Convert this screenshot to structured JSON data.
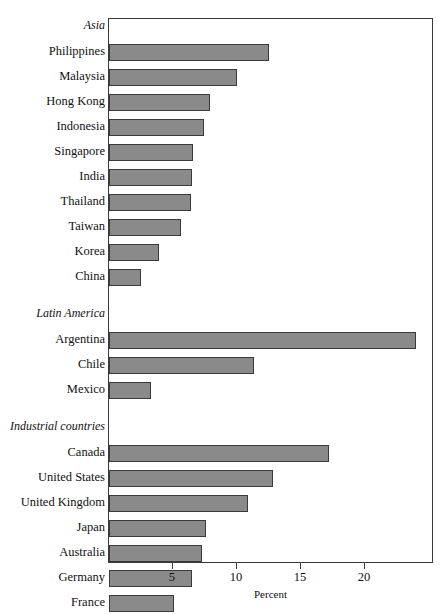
{
  "chart_data": {
    "type": "bar",
    "orientation": "horizontal",
    "title": "",
    "xlabel": "Percent",
    "ylabel": "",
    "xlim": [
      0,
      25.4
    ],
    "grid": false,
    "legend": null,
    "xticks": [
      5,
      10,
      15,
      20
    ],
    "xtick_labels": [
      "5",
      "10",
      "15",
      "20"
    ],
    "groups": [
      {
        "name": "Asia",
        "categories": [
          "Philippines",
          "Malaysia",
          "Hong Kong",
          "Indonesia",
          "Singapore",
          "India",
          "Thailand",
          "Taiwan",
          "Korea",
          "China"
        ],
        "values": [
          12.5,
          10.0,
          7.9,
          7.4,
          6.6,
          6.5,
          6.4,
          5.6,
          3.9,
          2.5
        ]
      },
      {
        "name": "Latin America",
        "categories": [
          "Argentina",
          "Chile",
          "Mexico"
        ],
        "values": [
          24.0,
          11.3,
          3.3
        ]
      },
      {
        "name": "Industrial countries",
        "categories": [
          "Canada",
          "United States",
          "United Kingdom",
          "Japan",
          "Australia",
          "Germany",
          "France"
        ],
        "values": [
          17.2,
          12.8,
          10.9,
          7.6,
          7.3,
          6.5,
          5.1
        ]
      }
    ]
  },
  "style": {
    "bar_fill": "#8a8a8a",
    "bar_stroke": "#3a3a3a",
    "axis_color": "#3a3a3a",
    "text_color": "#111111"
  }
}
